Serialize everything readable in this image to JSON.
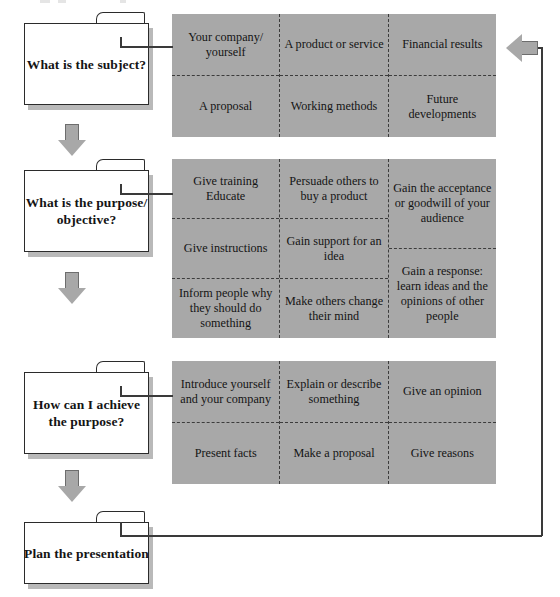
{
  "diagram": {
    "colors": {
      "cell_fill": "#a8a8a8",
      "box_fill": "#ffffff",
      "line": "#3a3a3a",
      "arrow_fill": "#a8a8a8",
      "arrow_stroke": "#6d6d6d",
      "text": "#141414"
    },
    "stages": [
      {
        "id": "subject",
        "box_label": "What is the subject?",
        "columns": [
          [
            "Your company/ yourself",
            "A proposal"
          ],
          [
            "A product or service",
            "Working methods"
          ],
          [
            "Financial results",
            "Future developments"
          ]
        ]
      },
      {
        "id": "purpose",
        "box_label": "What is the purpose/ objective?",
        "columns": [
          [
            "Give training Educate",
            "Give instructions",
            "Inform people why they should do something"
          ],
          [
            "Persuade others to buy a product",
            "Gain support for an idea",
            "Make others change their mind"
          ],
          [
            "Gain the acceptance or goodwill of your audience",
            "Gain a response: learn ideas and the opinions of other people"
          ]
        ]
      },
      {
        "id": "achieve",
        "box_label": "How can I achieve the purpose?",
        "columns": [
          [
            "Introduce yourself and your company",
            "Present facts"
          ],
          [
            "Explain or describe something",
            "Make a proposal"
          ],
          [
            "Give an opinion",
            "Give reasons"
          ]
        ]
      }
    ],
    "final_box_label": "Plan the presentation",
    "arrows": {
      "down_icon": "down-block-arrow",
      "feedback_icon": "left-block-arrow"
    }
  }
}
